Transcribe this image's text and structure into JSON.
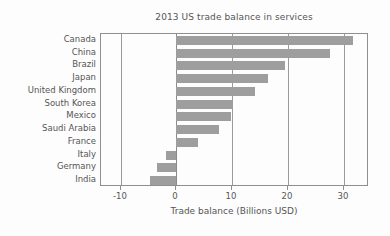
{
  "chart_data": {
    "type": "bar",
    "orientation": "horizontal",
    "title": "2013 US trade balance in services",
    "xlabel": "Trade balance (Billions USD)",
    "ylabel": "",
    "categories": [
      "Canada",
      "China",
      "Brazil",
      "Japan",
      "United Kingdom",
      "South Korea",
      "Mexico",
      "Saudi Arabia",
      "France",
      "Italy",
      "Germany",
      "India"
    ],
    "values": [
      31.7,
      27.5,
      19.4,
      16.4,
      14.1,
      10.2,
      9.7,
      7.7,
      3.8,
      -1.8,
      -3.5,
      -4.8
    ],
    "xlim": [
      -13.5,
      34.5
    ],
    "xticks": [
      -10,
      0,
      10,
      20,
      30
    ],
    "xtick_labels": [
      "-10",
      "0",
      "10",
      "20",
      "30"
    ],
    "grid": true,
    "grid_axis": "x",
    "legend": false,
    "bar_color": "#9e9e9e",
    "frame_color": "#8f8f8f",
    "text_color": "#555555",
    "background_color": "#fdfdfd"
  }
}
